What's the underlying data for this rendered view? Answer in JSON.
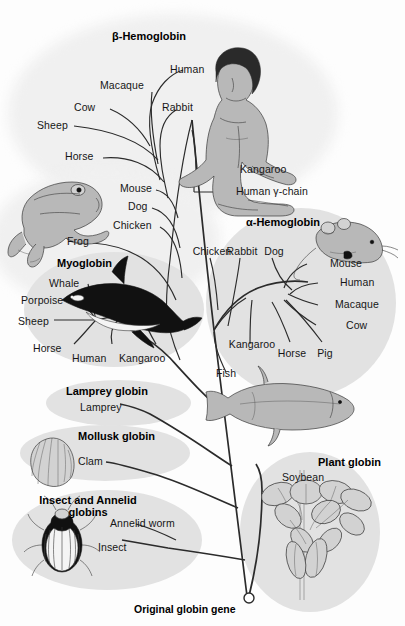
{
  "figure": {
    "root_label": "Original globin gene",
    "background_color": "#fdfdfd",
    "blob_color": "#e2e2e2",
    "line_color": "#2b2b2b"
  },
  "groups": {
    "beta_hemoglobin": {
      "label": "β-Hemoglobin",
      "taxa": [
        "Human",
        "Macaque",
        "Rabbit",
        "Cow",
        "Sheep",
        "Horse",
        "Mouse",
        "Dog",
        "Chicken",
        "Frog",
        "Kangaroo",
        "Human γ-chain"
      ],
      "illustrations": [
        "human-figure",
        "frog"
      ]
    },
    "alpha_hemoglobin": {
      "label": "α-Hemoglobin",
      "taxa": [
        "Chicken",
        "Rabbit",
        "Dog",
        "Mouse",
        "Human",
        "Macaque",
        "Cow",
        "Kangaroo",
        "Horse",
        "Pig",
        "Fish"
      ],
      "illustrations": [
        "mouse",
        "fish"
      ]
    },
    "myoglobin": {
      "label": "Myoglobin",
      "taxa": [
        "Whale",
        "Porpoise",
        "Sheep",
        "Horse",
        "Human",
        "Kangaroo"
      ],
      "illustrations": [
        "whale"
      ]
    },
    "lamprey_globin": {
      "label": "Lamprey globin",
      "taxa": [
        "Lamprey"
      ],
      "illustrations": []
    },
    "mollusk_globin": {
      "label": "Mollusk globin",
      "taxa": [
        "Clam"
      ],
      "illustrations": [
        "clam"
      ]
    },
    "insect_annelid_globins": {
      "label_line1": "Insect and Annelid",
      "label_line2": "globins",
      "taxa": [
        "Annelid worm",
        "Insect"
      ],
      "illustrations": [
        "beetle"
      ]
    },
    "plant_globin": {
      "label": "Plant globin",
      "taxa": [
        "Soybean"
      ],
      "illustrations": [
        "soybean-plant"
      ]
    }
  },
  "labels": {
    "beta": {
      "human": "Human",
      "macaque": "Macaque",
      "rabbit": "Rabbit",
      "cow": "Cow",
      "sheep": "Sheep",
      "horse": "Horse",
      "mouse": "Mouse",
      "dog": "Dog",
      "chicken": "Chicken",
      "frog": "Frog",
      "kangaroo": "Kangaroo",
      "gamma": "Human γ-chain"
    },
    "alpha": {
      "chicken": "Chicken",
      "rabbit": "Rabbit",
      "dog": "Dog",
      "mouse": "Mouse",
      "human": "Human",
      "macaque": "Macaque",
      "cow": "Cow",
      "kangaroo": "Kangaroo",
      "horse": "Horse",
      "pig": "Pig",
      "fish": "Fish"
    },
    "myoglobin": {
      "whale": "Whale",
      "porpoise": "Porpoise",
      "sheep": "Sheep",
      "horse": "Horse",
      "human": "Human",
      "kangaroo": "Kangaroo"
    },
    "lamprey": "Lamprey",
    "clam": "Clam",
    "annelid_worm": "Annelid worm",
    "insect": "Insect",
    "soybean": "Soybean"
  },
  "headings": {
    "beta_hemoglobin": "β-Hemoglobin",
    "alpha_hemoglobin": "α-Hemoglobin",
    "myoglobin": "Myoglobin",
    "lamprey_globin": "Lamprey globin",
    "mollusk_globin": "Mollusk globin",
    "insect_annelid_1": "Insect and Annelid",
    "insect_annelid_2": "globins",
    "plant_globin": "Plant globin"
  },
  "root": {
    "label": "Original globin gene"
  }
}
